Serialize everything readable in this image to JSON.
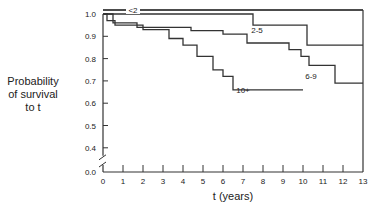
{
  "chart_data": {
    "type": "line",
    "subtype": "kaplan-meier step",
    "title": "",
    "xlabel": "t (years)",
    "ylabel": "Probability of survival to t",
    "ylabel_lines": [
      "Probability",
      "of survival",
      "to t"
    ],
    "xlim": [
      0,
      13
    ],
    "ylim": [
      0.0,
      1.0
    ],
    "y_axis_break": "between 0.0 and 0.4",
    "x_ticks": [
      "0",
      "1",
      "2",
      "3",
      "4",
      "5",
      "6",
      "7",
      "8",
      "9",
      "10",
      "11",
      "12",
      "13"
    ],
    "y_ticks": [
      "0.0",
      "0.4",
      "0.5",
      "0.6",
      "0.7",
      "0.8",
      "0.9",
      "1.0"
    ],
    "grid": false,
    "legend": "inline labels",
    "series": [
      {
        "name": "<2",
        "label_at": [
          1.5,
          1.0
        ],
        "steps": [
          [
            0,
            1.0
          ],
          [
            13,
            1.0
          ]
        ]
      },
      {
        "name": "2-5",
        "label_at": [
          7.7,
          0.93
        ],
        "steps": [
          [
            0,
            1.0
          ],
          [
            7.5,
            1.0
          ],
          [
            7.5,
            0.95
          ],
          [
            10.2,
            0.95
          ],
          [
            10.2,
            0.86
          ],
          [
            13,
            0.86
          ]
        ]
      },
      {
        "name": "6-9",
        "label_at": [
          10.4,
          0.72
        ],
        "steps": [
          [
            0,
            1.0
          ],
          [
            0.5,
            1.0
          ],
          [
            0.5,
            0.96
          ],
          [
            1.7,
            0.96
          ],
          [
            1.7,
            0.94
          ],
          [
            4.4,
            0.94
          ],
          [
            4.4,
            0.925
          ],
          [
            6.0,
            0.925
          ],
          [
            6.0,
            0.91
          ],
          [
            7.2,
            0.91
          ],
          [
            7.2,
            0.87
          ],
          [
            9.3,
            0.87
          ],
          [
            9.3,
            0.84
          ],
          [
            9.9,
            0.84
          ],
          [
            9.9,
            0.81
          ],
          [
            10.3,
            0.81
          ],
          [
            10.3,
            0.77
          ],
          [
            11.6,
            0.77
          ],
          [
            11.6,
            0.69
          ],
          [
            13,
            0.69
          ]
        ]
      },
      {
        "name": "10+",
        "label_at": [
          7.0,
          0.66
        ],
        "steps": [
          [
            0,
            1.0
          ],
          [
            0.2,
            1.0
          ],
          [
            0.2,
            0.97
          ],
          [
            0.6,
            0.97
          ],
          [
            0.6,
            0.95
          ],
          [
            2.0,
            0.95
          ],
          [
            2.0,
            0.93
          ],
          [
            3.3,
            0.93
          ],
          [
            3.3,
            0.89
          ],
          [
            4.0,
            0.89
          ],
          [
            4.0,
            0.86
          ],
          [
            4.7,
            0.86
          ],
          [
            4.7,
            0.81
          ],
          [
            5.5,
            0.81
          ],
          [
            5.5,
            0.75
          ],
          [
            6.0,
            0.75
          ],
          [
            6.0,
            0.72
          ],
          [
            6.5,
            0.72
          ],
          [
            6.5,
            0.66
          ],
          [
            10.0,
            0.66
          ]
        ]
      }
    ]
  }
}
